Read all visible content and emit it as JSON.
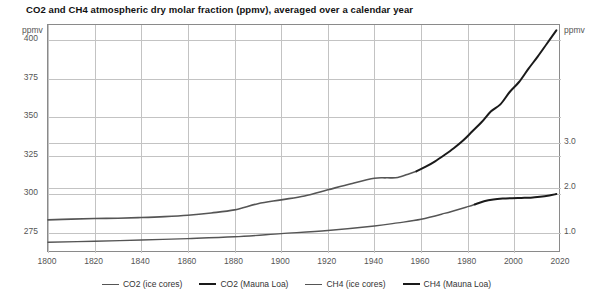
{
  "chart_data": {
    "type": "line",
    "title": "CO2 and CH4 atmospheric dry molar fraction (ppmv), averaged over a calendar year",
    "xlabel": "",
    "ylabel": "ppmv",
    "ylabel_right": "ppmv",
    "xlim": [
      1800,
      2020
    ],
    "ylim": [
      262,
      410
    ],
    "ylim_right": [
      0.55,
      5.62
    ],
    "grid": true,
    "legend_position": "bottom",
    "xticks": [
      1800,
      1820,
      1840,
      1860,
      1880,
      1900,
      1920,
      1940,
      1960,
      1980,
      2000,
      2020
    ],
    "xtick_labels": [
      "1800",
      "1820",
      "1840",
      "1860",
      "1880",
      "1900",
      "1920",
      "1940",
      "1960",
      "1980",
      "2000",
      "2020"
    ],
    "yticks": [
      275,
      300,
      325,
      350,
      375,
      400
    ],
    "ytick_labels": [
      "275",
      "300",
      "325",
      "350",
      "375",
      "400"
    ],
    "yticks_right": [
      1.0,
      2.0,
      3.0
    ],
    "ytick_labels_right": [
      "1.0",
      "2.0",
      "3.0"
    ],
    "series": [
      {
        "name": "CO2 (ice cores)",
        "axis": "left",
        "color": "#555555",
        "width": 1.6,
        "x": [
          1800,
          1810,
          1820,
          1830,
          1840,
          1850,
          1860,
          1870,
          1880,
          1890,
          1900,
          1910,
          1920,
          1930,
          1940,
          1945,
          1950,
          1955,
          1958
        ],
        "y": [
          283.5,
          284.0,
          284.4,
          284.6,
          285.0,
          285.6,
          286.5,
          288.0,
          290.0,
          294.0,
          296.5,
          299.0,
          303.0,
          307.0,
          310.5,
          310.8,
          311.0,
          313.5,
          315.0
        ]
      },
      {
        "name": "CO2 (Mauna Loa)",
        "axis": "left",
        "color": "#1a1a1a",
        "width": 2.0,
        "x": [
          1958,
          1962,
          1966,
          1970,
          1974,
          1978,
          1982,
          1986,
          1990,
          1994,
          1998,
          2002,
          2006,
          2010,
          2014,
          2018
        ],
        "y": [
          315.0,
          318.0,
          321.5,
          325.6,
          330.0,
          335.0,
          341.0,
          347.0,
          354.0,
          358.5,
          366.5,
          373.0,
          381.5,
          389.5,
          398.0,
          406.5
        ]
      },
      {
        "name": "CH4 (ice cores)",
        "axis": "right",
        "color": "#555555",
        "width": 1.4,
        "x": [
          1800,
          1820,
          1840,
          1860,
          1880,
          1900,
          1920,
          1940,
          1950,
          1960,
          1970,
          1980,
          1983
        ],
        "y": [
          0.79,
          0.81,
          0.84,
          0.87,
          0.91,
          0.98,
          1.05,
          1.15,
          1.22,
          1.3,
          1.43,
          1.58,
          1.63
        ]
      },
      {
        "name": "CH4 (Mauna Loa)",
        "axis": "right",
        "color": "#1a1a1a",
        "width": 2.0,
        "x": [
          1983,
          1987,
          1991,
          1995,
          1999,
          2003,
          2007,
          2011,
          2015,
          2018
        ],
        "y": [
          1.63,
          1.7,
          1.74,
          1.76,
          1.77,
          1.775,
          1.78,
          1.8,
          1.83,
          1.86
        ]
      }
    ]
  },
  "axes": {
    "left_unit": "ppmv",
    "right_unit": "ppmv"
  },
  "colors": {
    "grid": "#c3c3c3",
    "frame": "#8a8a8a",
    "ice": "#555555",
    "modern": "#1a1a1a",
    "background": "#ffffff"
  }
}
